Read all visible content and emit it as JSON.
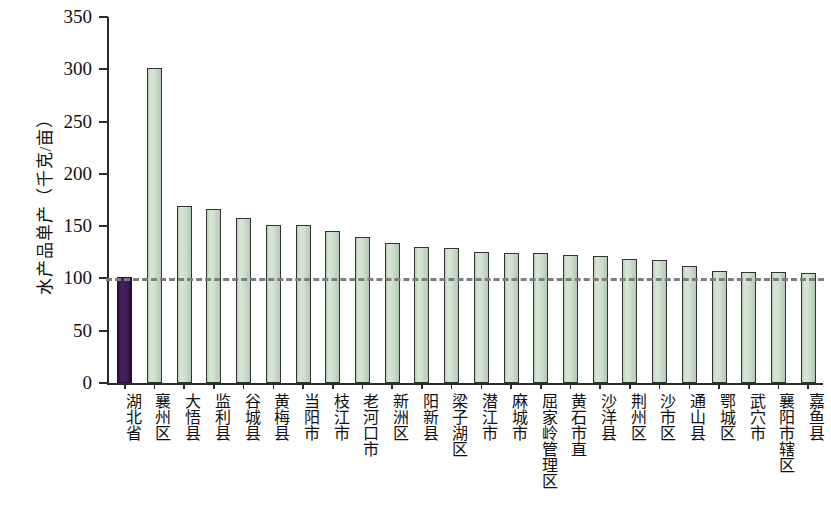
{
  "chart_data": {
    "type": "bar",
    "title": "",
    "xlabel": "",
    "ylabel": "水产品单产（千克/亩）",
    "ylim": [
      0,
      350
    ],
    "ytick_labels": [
      "350",
      "300",
      "250",
      "200",
      "150",
      "100",
      "50",
      "0"
    ],
    "ytick_values": [
      350,
      300,
      250,
      200,
      150,
      100,
      50,
      0
    ],
    "grid": false,
    "legend": "none",
    "reference_line": {
      "value": 100,
      "style": "dashed",
      "color": "#7d7d7d",
      "label": ""
    },
    "colors": {
      "highlight_bar": "#3e1a55",
      "bar": "#cfe0ce",
      "bar_outline": "#333333",
      "axis": "#2b2b2b",
      "reference": "#7d7d7d"
    },
    "categories": [
      "湖北省",
      "襄州区",
      "大悟县",
      "监利县",
      "谷城县",
      "黄梅县",
      "当阳市",
      "枝江市",
      "老河口市",
      "新洲区",
      "阳新县",
      "梁子湖区",
      "潜江市",
      "麻城市",
      "屈家岭管理区",
      "黄石市直",
      "沙洋县",
      "荆州区",
      "沙市区",
      "通山县",
      "鄂城区",
      "武穴市",
      "襄阳市辖区",
      "嘉鱼县"
    ],
    "values": [
      101,
      301,
      169,
      166,
      158,
      151,
      151,
      145,
      140,
      134,
      130,
      129,
      125,
      124,
      124,
      122,
      121,
      119,
      118,
      112,
      107,
      106,
      106,
      105
    ],
    "highlight_index": 0
  }
}
